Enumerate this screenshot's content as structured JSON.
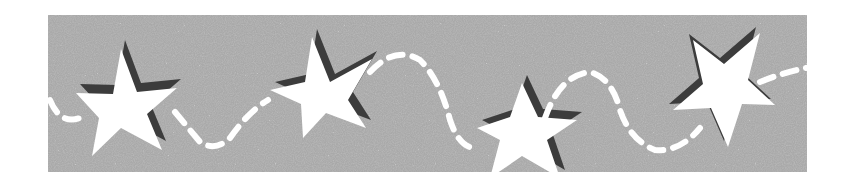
{
  "image": {
    "description": "Decorative banner: gray speckled texture with four white five-pointed stars with dark drop shadows, connected by a white dashed wavy line",
    "width": 856,
    "height": 187
  },
  "colors": {
    "page_background": "#ffffff",
    "banner_fill": "#a9a9a9",
    "speckle_light": "#c8c8c8",
    "speckle_dark": "#8a8a8a",
    "star_fill": "#ffffff",
    "star_shadow": "#3c3c3c",
    "dash_stroke": "#ffffff"
  },
  "banner": {
    "x": 48,
    "y": 15,
    "width": 759,
    "height": 157
  },
  "stars": [
    {
      "name": "star-1",
      "points": [
        [
          121,
          49
        ],
        [
          137,
          92
        ],
        [
          177,
          88
        ],
        [
          147,
          114
        ],
        [
          162,
          150
        ],
        [
          121,
          128
        ],
        [
          92,
          156
        ],
        [
          99,
          118
        ],
        [
          76,
          93
        ],
        [
          113,
          94
        ]
      ],
      "shadow_offset": [
        4,
        -9
      ]
    },
    {
      "name": "star-2",
      "points": [
        [
          312,
          37
        ],
        [
          330,
          82
        ],
        [
          372,
          59
        ],
        [
          348,
          100
        ],
        [
          366,
          128
        ],
        [
          326,
          113
        ],
        [
          303,
          138
        ],
        [
          301,
          104
        ],
        [
          270,
          90
        ],
        [
          305,
          82
        ]
      ],
      "shadow_offset": [
        5,
        -8
      ]
    },
    {
      "name": "star-3",
      "points": [
        [
          522,
          83
        ],
        [
          538,
          117
        ],
        [
          577,
          120
        ],
        [
          547,
          140
        ],
        [
          560,
          178
        ],
        [
          522,
          156
        ],
        [
          490,
          178
        ],
        [
          500,
          140
        ],
        [
          477,
          128
        ],
        [
          510,
          117
        ]
      ],
      "shadow_offset": [
        5,
        -8
      ]
    },
    {
      "name": "star-4",
      "points": [
        [
          693,
          40
        ],
        [
          724,
          64
        ],
        [
          760,
          33
        ],
        [
          748,
          80
        ],
        [
          775,
          105
        ],
        [
          742,
          104
        ],
        [
          728,
          147
        ],
        [
          711,
          108
        ],
        [
          673,
          110
        ],
        [
          703,
          84
        ]
      ],
      "shadow_offset": [
        -4,
        -6
      ]
    }
  ],
  "dash_path": {
    "d": "M 50 100 Q 60 125 80 118 M 175 112 Q 190 130 200 142 Q 215 152 230 138 Q 248 112 268 100 M 370 72 Q 395 45 420 60 Q 440 80 450 120 Q 460 150 478 148 M 545 118 Q 560 75 590 72 Q 612 78 620 110 Q 630 140 655 150 Q 680 152 700 128 M 760 82 Q 785 72 806 68",
    "stroke_width": 6,
    "dasharray": "14 10"
  }
}
